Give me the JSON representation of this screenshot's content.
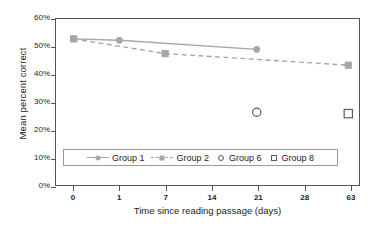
{
  "chart_data": {
    "type": "line",
    "title": "",
    "xlabel": "Time since reading passage (days)",
    "ylabel": "Mean percent correct",
    "x": [
      0,
      1,
      7,
      14,
      21,
      28,
      63
    ],
    "xtick_labels": [
      "0",
      "1",
      "7",
      "14",
      "21",
      "28",
      "63"
    ],
    "x_scale": "categorical",
    "ytick_labels": [
      "0%",
      "10%",
      "20%",
      "30%",
      "40%",
      "50%",
      "60%"
    ],
    "ytick_values": [
      0,
      10,
      20,
      30,
      40,
      50,
      60
    ],
    "ylim": [
      0,
      60
    ],
    "grid": false,
    "legend_position": "inside-lower-center",
    "series": [
      {
        "name": "Group 1",
        "style": "solid",
        "marker": "filled-circle",
        "color": "#a6a6a6",
        "points": [
          {
            "x": "0",
            "y": 52.8
          },
          {
            "x": "1",
            "y": 52.3
          },
          {
            "x": "21",
            "y": 49.0
          }
        ]
      },
      {
        "name": "Group 2",
        "style": "dashed",
        "marker": "filled-square",
        "color": "#a6a6a6",
        "points": [
          {
            "x": "0",
            "y": 52.8
          },
          {
            "x": "7",
            "y": 47.5
          },
          {
            "x": "63",
            "y": 43.3
          }
        ]
      },
      {
        "name": "Group 6",
        "style": "none",
        "marker": "open-circle",
        "color": "#5a5a5a",
        "points": [
          {
            "x": "21",
            "y": 26.3
          }
        ]
      },
      {
        "name": "Group 8",
        "style": "none",
        "marker": "open-square",
        "color": "#5a5a5a",
        "points": [
          {
            "x": "63",
            "y": 25.8
          }
        ]
      }
    ]
  },
  "axes": {
    "x_title": "Time since reading passage (days)",
    "y_title": "Mean percent correct"
  },
  "legend": {
    "entries": [
      {
        "label": "Group 1",
        "marker": "filled-circle",
        "line": "solid"
      },
      {
        "label": "Group 2",
        "marker": "filled-square",
        "line": "dashed"
      },
      {
        "label": "Group 6",
        "marker": "open-circle",
        "line": "none"
      },
      {
        "label": "Group 8",
        "marker": "open-square",
        "line": "none"
      }
    ]
  },
  "colors": {
    "series_gray": "#a6a6a6",
    "open_marker": "#5a5a5a",
    "axis": "#555555",
    "text": "#1c1c1c"
  }
}
